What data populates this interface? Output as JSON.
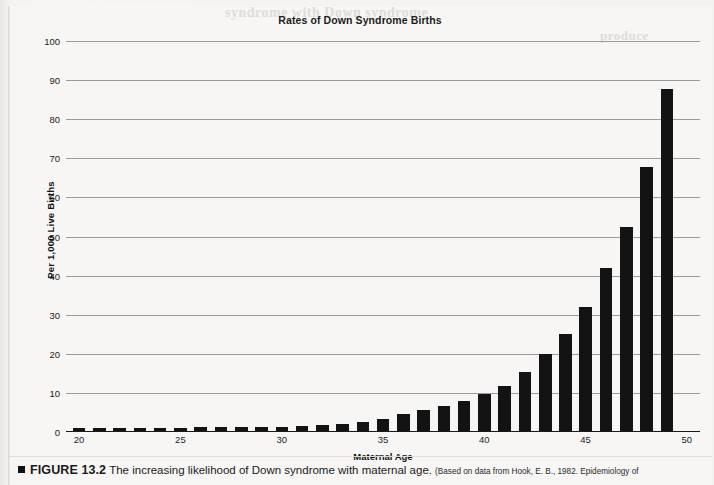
{
  "figure": {
    "marker": "■",
    "number": "FIGURE 13.2",
    "text": "The increasing likelihood of Down syndrome with maternal age.",
    "source": "(Based on data from Hook, E. B., 1982. Epidemiology of"
  },
  "ghost_text": {
    "line1": "syndrome with Down syndrome",
    "line2": "produce"
  },
  "chart_data": {
    "type": "bar",
    "title": "Rates of Down Syndrome Births",
    "xlabel": "Maternal Age",
    "ylabel": "Per 1,000 Live Births",
    "ylim": [
      0,
      100
    ],
    "ytick_labels": [
      "100",
      "90",
      "80",
      "70",
      "60",
      "50",
      "40",
      "30",
      "20",
      "10",
      "0"
    ],
    "yticks": [
      100,
      90,
      80,
      70,
      60,
      50,
      40,
      30,
      20,
      10,
      0
    ],
    "xtick_labels": [
      "20",
      "25",
      "30",
      "35",
      "40",
      "45",
      "50"
    ],
    "xticks": [
      20,
      25,
      30,
      35,
      40,
      45,
      50
    ],
    "grid": true,
    "legend": "none",
    "bar_color": "#131313",
    "categories": [
      20,
      21,
      22,
      23,
      24,
      25,
      26,
      27,
      28,
      29,
      30,
      31,
      32,
      33,
      34,
      35,
      36,
      37,
      38,
      39,
      40,
      41,
      42,
      43,
      44,
      45,
      46,
      47,
      48,
      49,
      50
    ],
    "values": [
      0.7,
      0.7,
      0.7,
      0.8,
      0.8,
      0.8,
      0.9,
      0.9,
      1.0,
      1.0,
      1.1,
      1.3,
      1.5,
      1.9,
      2.4,
      3.2,
      4.3,
      5.5,
      6.3,
      7.6,
      9.5,
      11.6,
      15.1,
      19.6,
      24.8,
      31.6,
      41.8,
      52.3,
      67.6,
      87.5,
      0.0
    ]
  }
}
